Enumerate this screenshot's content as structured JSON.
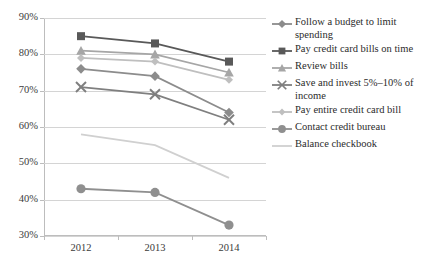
{
  "chart_data": {
    "type": "line",
    "title": "",
    "xlabel": "",
    "ylabel": "",
    "categories": [
      "2012",
      "2013",
      "2014"
    ],
    "x_tick_labels": [
      "2012",
      "2013",
      "2014"
    ],
    "y_tick_labels": [
      "90%",
      "80%",
      "70%",
      "60%",
      "50%",
      "40%",
      "30%"
    ],
    "y_tick_values": [
      90,
      80,
      70,
      60,
      50,
      40,
      30
    ],
    "ylim": [
      30,
      90
    ],
    "y_unit": "%",
    "grid": "horizontal",
    "legend_position": "right",
    "series": [
      {
        "name": "Follow a budget to limit spending",
        "marker": "diamond",
        "color": "#8c8c8c",
        "values": [
          76,
          74,
          64
        ]
      },
      {
        "name": "Pay credit card bills on time",
        "marker": "square",
        "color": "#595959",
        "values": [
          85,
          83,
          78
        ]
      },
      {
        "name": "Review bills",
        "marker": "triangle",
        "color": "#a6a6a6",
        "values": [
          81,
          80,
          75
        ]
      },
      {
        "name": "Save and invest 5%–10% of income",
        "marker": "cross",
        "color": "#7f7f7f",
        "values": [
          71,
          69,
          62
        ]
      },
      {
        "name": "Pay entire credit card bill",
        "marker": "diamond-small",
        "color": "#bfbfbf",
        "values": [
          79,
          78,
          73
        ]
      },
      {
        "name": "Contact credit bureau",
        "marker": "circle",
        "color": "#8f8f8f",
        "values": [
          43,
          42,
          33
        ]
      },
      {
        "name": "Balance checkbook",
        "marker": "none",
        "color": "#d0d0d0",
        "values": [
          58,
          55,
          46
        ]
      }
    ]
  },
  "colors": {
    "gridline": "#d4d4d4",
    "axis": "#bdbdbd",
    "tick_text": "#3b3b3b",
    "legend_text": "#2b2b2b",
    "background": "#ffffff"
  }
}
